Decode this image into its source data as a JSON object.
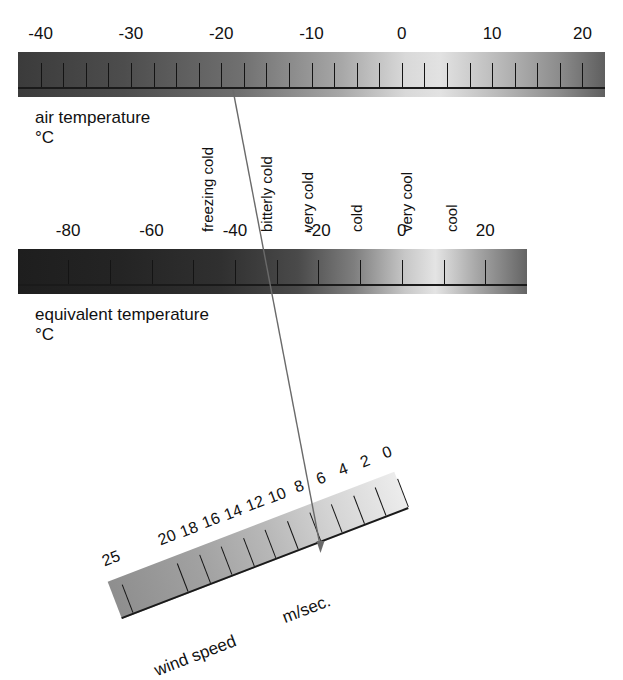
{
  "figure": {
    "background_color": "#ffffff",
    "line_color": "#5a5a5a"
  },
  "chart_data": {
    "type": "table",
    "scales": [
      {
        "name": "air temperature",
        "unit": "°C",
        "caption": "air temperature\n°C",
        "axis_min": -42.5,
        "axis_max": 22.5,
        "major_labels": [
          -40,
          -30,
          -20,
          -10,
          0,
          10,
          20
        ],
        "major_label_text": [
          "-40",
          "-30",
          "-20",
          "-10",
          "0",
          "10",
          "20"
        ],
        "tick_values": [
          -40,
          -37.5,
          -35,
          -32.5,
          -30,
          -27.5,
          -25,
          -22.5,
          -20,
          -17.5,
          -15,
          -12.5,
          -10,
          -7.5,
          -5,
          -2.5,
          0,
          2.5,
          5,
          7.5,
          10,
          12.5,
          15,
          17.5,
          20
        ],
        "gradient_stops": [
          {
            "pos": 0,
            "color": "#3b3b3b"
          },
          {
            "pos": 18,
            "color": "#4d4d4d"
          },
          {
            "pos": 38,
            "color": "#707070"
          },
          {
            "pos": 55,
            "color": "#a7a7a7"
          },
          {
            "pos": 66,
            "color": "#d9d9d9"
          },
          {
            "pos": 72,
            "color": "#e2e2e2"
          },
          {
            "pos": 82,
            "color": "#b9b9b9"
          },
          {
            "pos": 92,
            "color": "#8d8d8d"
          },
          {
            "pos": 100,
            "color": "#5f5f5f"
          }
        ]
      },
      {
        "name": "equivalent temperature",
        "unit": "°C",
        "caption": "equivalent temperature\n°C",
        "axis_min": -92,
        "axis_max": 30,
        "major_labels": [
          -80,
          -60,
          -40,
          -20,
          0,
          20
        ],
        "major_label_text": [
          "-80",
          "-60",
          "-40",
          "-20",
          "0",
          "20"
        ],
        "tick_values": [
          -80,
          -70,
          -60,
          -50,
          -40,
          -30,
          -20,
          -10,
          0,
          10,
          20
        ],
        "gradient_stops": [
          {
            "pos": 0,
            "color": "#1e1e1e"
          },
          {
            "pos": 20,
            "color": "#242424"
          },
          {
            "pos": 40,
            "color": "#303030"
          },
          {
            "pos": 55,
            "color": "#4a4a4a"
          },
          {
            "pos": 66,
            "color": "#7e7e7e"
          },
          {
            "pos": 76,
            "color": "#c7c7c7"
          },
          {
            "pos": 82,
            "color": "#e4e4e4"
          },
          {
            "pos": 90,
            "color": "#a8a8a8"
          },
          {
            "pos": 100,
            "color": "#646464"
          }
        ]
      },
      {
        "name": "wind speed",
        "unit": "m/sec.",
        "caption": "wind speed",
        "unit_label": "m/sec.",
        "axis_min": 0,
        "axis_max": 26,
        "direction": "reversed",
        "rotation_deg": -21,
        "major_label_text": [
          "25",
          "20",
          "18",
          "16",
          "14",
          "12",
          "10",
          "8",
          "6",
          "4",
          "2",
          "0"
        ],
        "major_labels": [
          25,
          20,
          18,
          16,
          14,
          12,
          10,
          8,
          6,
          4,
          2,
          0
        ],
        "tick_values": [
          25,
          20,
          18,
          16,
          14,
          12,
          10,
          8,
          6,
          4,
          2,
          0
        ],
        "gradient_stops": [
          {
            "pos": 0,
            "color": "#8e8e8e"
          },
          {
            "pos": 30,
            "color": "#a1a1a1"
          },
          {
            "pos": 55,
            "color": "#b9b9b9"
          },
          {
            "pos": 75,
            "color": "#d3d3d3"
          },
          {
            "pos": 100,
            "color": "#ececec"
          }
        ]
      }
    ],
    "sensation_words": [
      {
        "label": "freezing cold",
        "at_air_temp": -20
      },
      {
        "label": "bitterly cold",
        "at_air_temp": -13.5
      },
      {
        "label": "very cold",
        "at_air_temp": -9
      },
      {
        "label": "cold",
        "at_air_temp": -3.5
      },
      {
        "label": "very cool",
        "at_air_temp": 2
      },
      {
        "label": "cool",
        "at_air_temp": 7
      }
    ],
    "connector_line": {
      "description": "reading line linking air temperature, equivalent temperature and wind speed",
      "from_air_temperature": -22,
      "to_wind_speed": 7
    }
  },
  "air": {
    "caption": "air temperature\n°C",
    "labels": [
      "-40",
      "-30",
      "-20",
      "-10",
      "0",
      "10",
      "20"
    ]
  },
  "equiv": {
    "caption": "equivalent temperature\n°C",
    "labels": [
      "-80",
      "-60",
      "-40",
      "-20",
      "0",
      "20"
    ]
  },
  "wind": {
    "caption": "wind speed",
    "unit_label": "m/sec.",
    "labels": [
      "25",
      "20",
      "18",
      "16",
      "14",
      "12",
      "10",
      "8",
      "6",
      "4",
      "2",
      "0"
    ]
  },
  "sensations": [
    "freezing cold",
    "bitterly cold",
    "very cold",
    "cold",
    "very cool",
    "cool"
  ]
}
